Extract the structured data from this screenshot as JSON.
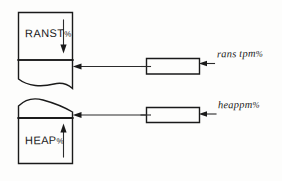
{
  "diagram": {
    "background_color": "#fdfdfc",
    "ink_color": "#1a1a1a"
  },
  "top_figure": {
    "name": "ranst-region",
    "label": "RANST",
    "label_suffix": "%",
    "arrow_direction": "down",
    "boundary_note": "curved lower edge"
  },
  "bottom_figure": {
    "name": "heap-region",
    "label": "HEAP",
    "label_suffix": "%",
    "arrow_direction": "up",
    "boundary_note": "sloping upper edge"
  },
  "connectors": {
    "top": {
      "name": "ranst-connector",
      "label": "rans tpm",
      "label_suffix": "%"
    },
    "bottom": {
      "name": "heap-connector",
      "label": "heappm",
      "label_suffix": "%"
    }
  }
}
